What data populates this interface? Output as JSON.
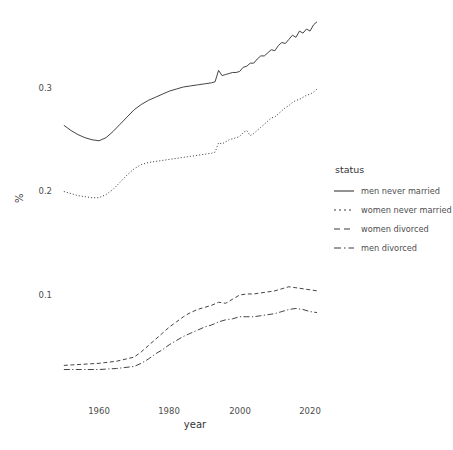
{
  "chart_data": {
    "type": "line",
    "title": "",
    "xlabel": "year",
    "ylabel": "%",
    "xlim": [
      1950,
      2022
    ],
    "ylim": [
      0.015,
      0.372
    ],
    "grid": false,
    "legend_position": "right",
    "legend_title": "status",
    "xticks": [
      1960,
      1980,
      2000,
      2020
    ],
    "xtick_labels": [
      "1960",
      "1980",
      "2000",
      "2020"
    ],
    "yticks": [
      0.1,
      0.2,
      0.3
    ],
    "ytick_labels": [
      "0.1",
      "0.2",
      "0.3"
    ],
    "line_color": "#3a3a3a",
    "series": [
      {
        "name": "men never married",
        "linestyle": "solid",
        "x": [
          1950,
          1952,
          1954,
          1956,
          1958,
          1960,
          1962,
          1964,
          1966,
          1968,
          1970,
          1972,
          1974,
          1976,
          1978,
          1980,
          1982,
          1984,
          1986,
          1988,
          1990,
          1992,
          1993,
          1994,
          1995,
          1996,
          1997,
          1998,
          1999,
          2000,
          2001,
          2002,
          2003,
          2004,
          2005,
          2006,
          2007,
          2008,
          2009,
          2010,
          2011,
          2012,
          2013,
          2014,
          2015,
          2016,
          2017,
          2018,
          2019,
          2020,
          2021,
          2022
        ],
        "values": [
          0.264,
          0.259,
          0.255,
          0.252,
          0.25,
          0.249,
          0.252,
          0.258,
          0.265,
          0.272,
          0.279,
          0.284,
          0.288,
          0.291,
          0.294,
          0.297,
          0.299,
          0.301,
          0.302,
          0.303,
          0.304,
          0.305,
          0.306,
          0.317,
          0.312,
          0.313,
          0.314,
          0.315,
          0.315,
          0.316,
          0.32,
          0.321,
          0.324,
          0.324,
          0.328,
          0.331,
          0.331,
          0.334,
          0.337,
          0.336,
          0.341,
          0.344,
          0.343,
          0.347,
          0.351,
          0.349,
          0.355,
          0.353,
          0.357,
          0.355,
          0.361,
          0.364
        ]
      },
      {
        "name": "women never married",
        "linestyle": "dotted",
        "x": [
          1950,
          1952,
          1954,
          1956,
          1958,
          1960,
          1962,
          1964,
          1966,
          1968,
          1970,
          1972,
          1974,
          1976,
          1978,
          1980,
          1982,
          1984,
          1986,
          1988,
          1990,
          1992,
          1993,
          1994,
          1995,
          1996,
          1997,
          1998,
          1999,
          2000,
          2001,
          2002,
          2003,
          2004,
          2005,
          2006,
          2007,
          2008,
          2009,
          2010,
          2011,
          2012,
          2013,
          2014,
          2015,
          2016,
          2017,
          2018,
          2019,
          2020,
          2021,
          2022
        ],
        "values": [
          0.2,
          0.198,
          0.196,
          0.195,
          0.194,
          0.194,
          0.197,
          0.202,
          0.209,
          0.216,
          0.222,
          0.226,
          0.228,
          0.229,
          0.23,
          0.231,
          0.232,
          0.233,
          0.234,
          0.235,
          0.236,
          0.237,
          0.238,
          0.247,
          0.246,
          0.248,
          0.25,
          0.251,
          0.252,
          0.253,
          0.257,
          0.259,
          0.254,
          0.256,
          0.259,
          0.262,
          0.265,
          0.268,
          0.271,
          0.272,
          0.275,
          0.278,
          0.281,
          0.283,
          0.286,
          0.288,
          0.289,
          0.291,
          0.293,
          0.294,
          0.296,
          0.299
        ]
      },
      {
        "name": "women divorced",
        "linestyle": "dashed",
        "x": [
          1950,
          1955,
          1960,
          1965,
          1970,
          1972,
          1974,
          1976,
          1978,
          1980,
          1982,
          1984,
          1986,
          1988,
          1990,
          1992,
          1994,
          1996,
          1998,
          2000,
          2002,
          2004,
          2006,
          2008,
          2010,
          2012,
          2014,
          2016,
          2018,
          2020,
          2022
        ],
        "values": [
          0.032,
          0.033,
          0.034,
          0.036,
          0.04,
          0.045,
          0.051,
          0.057,
          0.063,
          0.069,
          0.074,
          0.079,
          0.083,
          0.086,
          0.088,
          0.09,
          0.093,
          0.092,
          0.096,
          0.1,
          0.101,
          0.101,
          0.102,
          0.103,
          0.104,
          0.106,
          0.108,
          0.107,
          0.106,
          0.105,
          0.104
        ]
      },
      {
        "name": "men divorced",
        "linestyle": "longdashdot",
        "x": [
          1950,
          1955,
          1960,
          1965,
          1970,
          1972,
          1974,
          1976,
          1978,
          1980,
          1982,
          1984,
          1986,
          1988,
          1990,
          1992,
          1994,
          1996,
          1998,
          2000,
          2002,
          2004,
          2006,
          2008,
          2010,
          2012,
          2014,
          2016,
          2018,
          2020,
          2022
        ],
        "values": [
          0.028,
          0.028,
          0.028,
          0.029,
          0.031,
          0.034,
          0.038,
          0.043,
          0.047,
          0.052,
          0.056,
          0.06,
          0.063,
          0.066,
          0.069,
          0.071,
          0.074,
          0.076,
          0.077,
          0.079,
          0.079,
          0.079,
          0.08,
          0.081,
          0.082,
          0.084,
          0.086,
          0.087,
          0.086,
          0.084,
          0.083
        ]
      }
    ]
  },
  "axes": {
    "x_title": "year",
    "y_title": "%",
    "x_tick_labels": [
      "1960",
      "1980",
      "2000",
      "2020"
    ],
    "y_tick_labels": [
      "0.3",
      "0.2",
      "0.1"
    ]
  },
  "legend": {
    "title": "status",
    "items": [
      {
        "label": "men never married",
        "style": "solid"
      },
      {
        "label": "women never married",
        "style": "dotted"
      },
      {
        "label": "women divorced",
        "style": "dashed"
      },
      {
        "label": "men divorced",
        "style": "longdashdot"
      }
    ]
  }
}
